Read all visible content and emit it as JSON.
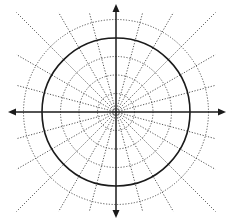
{
  "diagram": {
    "type": "polar-grid",
    "center": {
      "x": 116,
      "y": 112
    },
    "ring_spacing_px": 18.5,
    "dotted_rings": [
      1,
      2,
      3,
      5
    ],
    "solid_ring": 4,
    "radial_line_angle_step_deg": 15,
    "radial_line_count": 24,
    "radial_line_length_px": 100,
    "axes": {
      "horizontal": {
        "x1": 8,
        "x2": 226
      },
      "vertical": {
        "y1": 4,
        "y2": 218
      }
    },
    "colors": {
      "axis": "#1a1a1a",
      "solid_ring": "#1a1a1a",
      "dotted": "#555555",
      "background": "#ffffff"
    }
  }
}
